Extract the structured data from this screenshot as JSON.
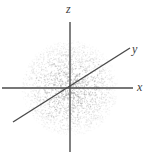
{
  "figure": {
    "kind": "3d-axes-scatter-cloud",
    "width": 156,
    "height": 155,
    "background_color": "#ffffff",
    "labels": {
      "z": "z",
      "y": "y",
      "x": "x"
    },
    "colors": {
      "axis": "#4a4a4a",
      "cloud": "#9a9a9a",
      "label": "#3d3d3d",
      "background": "#ffffff"
    }
  },
  "chart_data": {
    "type": "scatter",
    "title": "",
    "xlabel": "x",
    "ylabel": "y",
    "zlabel": "z",
    "grid": false,
    "legend": null,
    "projection": "oblique-3d",
    "origin_px": [
      70,
      88
    ],
    "axes": [
      {
        "name": "z",
        "direction": "up",
        "from_px": [
          70,
          152
        ],
        "to_px": [
          70,
          22
        ],
        "label": "z",
        "label_px": [
          66,
          3
        ]
      },
      {
        "name": "y",
        "direction": "up-right-depth",
        "from_px": [
          13,
          122
        ],
        "to_px": [
          130,
          48
        ],
        "label": "y",
        "label_px": [
          132,
          43
        ]
      },
      {
        "name": "x",
        "direction": "right",
        "from_px": [
          2,
          88
        ],
        "to_px": [
          133,
          88
        ],
        "label": "x",
        "label_px": [
          137,
          81
        ]
      }
    ],
    "cloud": {
      "shape": "sphere",
      "center_px": [
        70,
        88
      ],
      "radius_px": 48,
      "point_count": 2600,
      "point_radius_px": 0.55,
      "color": "#9a9a9a",
      "density_profile": "center-weighted-falloff",
      "opacity_center": 0.55,
      "opacity_edge": 0.05
    }
  }
}
